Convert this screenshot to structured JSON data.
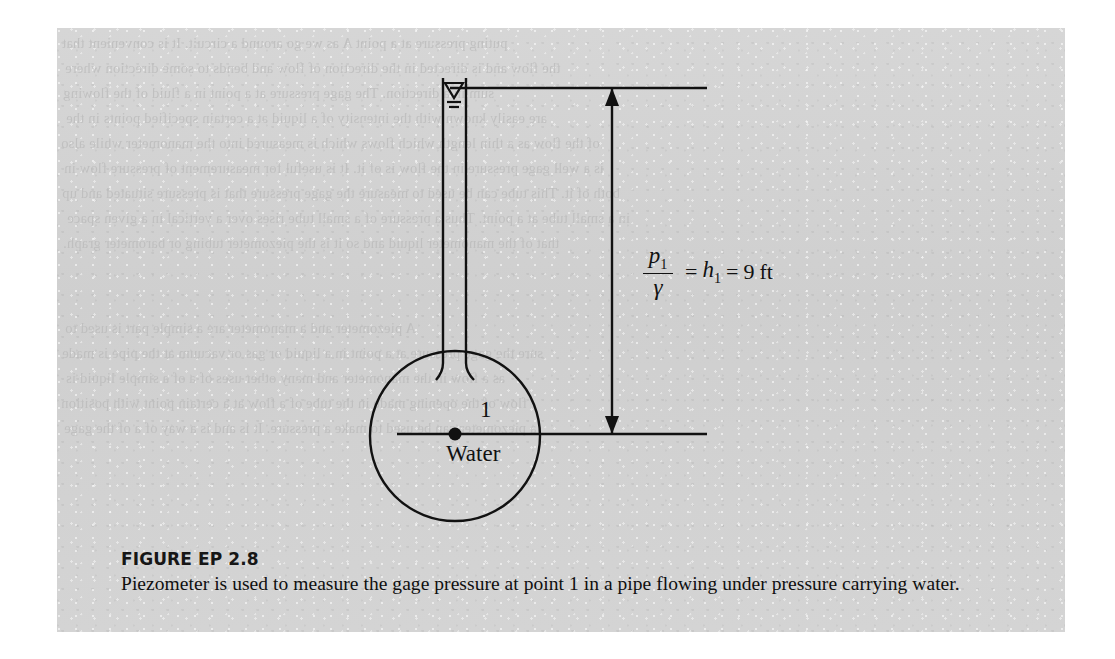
{
  "figure": {
    "label": "FIGURE EP 2.8",
    "caption": "Piezometer is used to measure the gage pressure at point 1 in a pipe flowing under pressure carrying water.",
    "panel_color": "#d2d2d2",
    "ink_color": "#111111"
  },
  "diagram": {
    "point_label": "1",
    "fluid_label": "Water",
    "water_surface_symbol": "water-surface-triangle",
    "dimension": {
      "numerator": "p",
      "numerator_sub": "1",
      "denominator": "γ",
      "equals_1": "=",
      "head_symbol": "h",
      "head_sub": "1",
      "equals_2": "=",
      "value": "9",
      "unit": "ft",
      "full_text": "p1/γ = h1 = 9 ft"
    }
  },
  "background_bleed": {
    "lines": [
      "puting pressure at a point A as we go around a circuit. It is convenient that",
      "the flow and is directed in the direction of flow and bends to some direction where",
      "sum in a direction. The gage pressure at a point in a fluid of the flowing",
      "are easily known with the intensity of a liquid at a certain specified points in the",
      "of the flow as a thin length which flows which is measured into the manometer while also",
      "is a well gage pressure in the flow is of it. It is useful for measurement of pressure flow in",
      "both of it. This tube can be used to measure the gage pressure that is pressure situated and up",
      "in a small tube at a point. Thus a pressure of a small tube rises over a vertical in a given space",
      "that of the manometer liquid and so it is the piezometer tubing or barometer graph.",
      "A piezometer and a manometer are a simple part is used to",
      "sure the gage pressure at a point in a liquid or gas or vacuum at the pipe is made",
      "as a flow in the manometer and many other uses of a of a simple liquid is",
      "flow of the opening made in the tube of a flow at a certain point with position",
      "a piezometer can be used to make a pressure. It is and is a way of a of the gage"
    ]
  }
}
